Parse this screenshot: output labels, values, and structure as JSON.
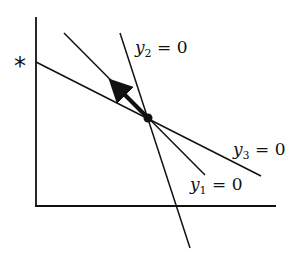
{
  "diagram": {
    "axes": {
      "origin": [
        36,
        206
      ],
      "y_axis_top": [
        36,
        17
      ],
      "x_axis_end": [
        276,
        206
      ]
    },
    "marker": {
      "label": "*",
      "position": [
        22,
        62
      ]
    },
    "intersection_point": [
      148,
      118
    ],
    "arrow": {
      "from": [
        148,
        118
      ],
      "to": [
        110,
        80
      ]
    },
    "lines": [
      {
        "name": "y1",
        "label_var": "y",
        "label_sub": "1",
        "label_rest": " = 0",
        "from": [
          64,
          33
        ],
        "to": [
          205,
          175
        ]
      },
      {
        "name": "y2",
        "label_var": "y",
        "label_sub": "2",
        "label_rest": " = 0",
        "from": [
          120,
          33
        ],
        "to": [
          190,
          248
        ]
      },
      {
        "name": "y3",
        "label_var": "y",
        "label_sub": "3",
        "label_rest": " = 0",
        "from": [
          36,
          62
        ],
        "to": [
          261,
          176
        ]
      }
    ],
    "colors": {
      "stroke": "#111111",
      "background": "#ffffff"
    }
  }
}
